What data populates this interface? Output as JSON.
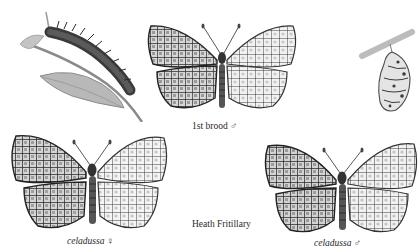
{
  "plate": {
    "title": "Heath Fritillary",
    "background": "#ffffff",
    "ink": "#2a2a2a",
    "wing_light": "#d8d8d8",
    "wing_dark": "#3a3a3a"
  },
  "figures": [
    {
      "id": "caterpillar",
      "subject": "caterpillar-on-leaf",
      "label": ""
    },
    {
      "id": "brood-male",
      "subject": "butterfly-upperside-underside",
      "label": "1st brood ♂"
    },
    {
      "id": "pupa",
      "subject": "pupa-hanging",
      "label": ""
    },
    {
      "id": "celadussa-female",
      "subject": "butterfly-upperside-underside",
      "label": "celadussa ♀"
    },
    {
      "id": "celadussa-male",
      "subject": "butterfly-upperside-underside",
      "label": "celadussa ♂"
    }
  ],
  "labels": {
    "brood_male": "1st brood ♂",
    "species": "Heath Fritillary",
    "celadussa_female": "celadussa ♀",
    "celadussa_male": "celadussa ♂"
  }
}
